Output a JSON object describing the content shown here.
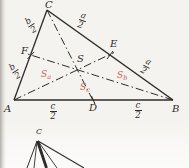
{
  "colors": {
    "ink": "#2e2b28",
    "red": "#c8614c",
    "paper": "#f5f3ef"
  },
  "main_diagram": {
    "description": "Triangle ABC with medians AD-BE-CF meeting at centroid S",
    "vertex_labels": {
      "A": "A",
      "B": "B",
      "C": "C"
    },
    "midpoint_labels": {
      "D": "D",
      "E": "E",
      "F": "F"
    },
    "centroid_label": "S",
    "fractions": {
      "a": {
        "num": "a",
        "den": "2"
      },
      "b": {
        "num": "b",
        "den": "2"
      },
      "c": {
        "num": "c",
        "den": "2"
      }
    },
    "area_labels": {
      "sa": {
        "base": "S",
        "sub": "a"
      },
      "sb": {
        "base": "S",
        "sub": "b"
      },
      "sc": {
        "base": "S",
        "sub": "c"
      }
    }
  },
  "figure2": {
    "apex_label": "C"
  }
}
